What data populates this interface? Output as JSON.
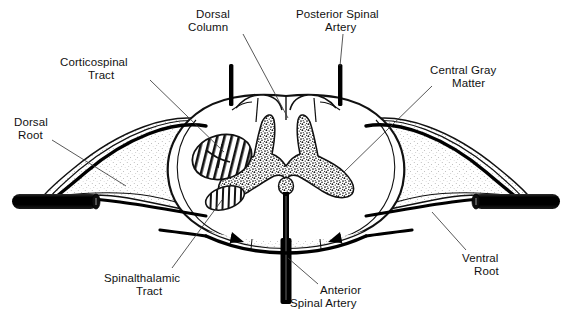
{
  "figure": {
    "kind": "anatomical-line-drawing",
    "background_color": "#ffffff",
    "ink_color": "#111111"
  },
  "labels": {
    "dorsal_column": {
      "line1": "Dorsal",
      "line2": "Column"
    },
    "posterior_spinal_artery": {
      "line1": "Posterior Spinal",
      "line2": "Artery"
    },
    "corticospinal_tract": {
      "line1": "Corticospinal",
      "line2": "Tract"
    },
    "central_gray_matter": {
      "line1": "Central Gray",
      "line2": "Matter"
    },
    "dorsal_root": {
      "line1": "Dorsal",
      "line2": "Root"
    },
    "ventral_root": {
      "line1": "Ventral",
      "line2": "Root"
    },
    "spinalthalamic_tract": {
      "line1": "Spinalthalamic",
      "line2": "Tract"
    },
    "anterior_spinal_artery": {
      "line1": "Anterior",
      "line2": "Spinal Artery"
    }
  }
}
